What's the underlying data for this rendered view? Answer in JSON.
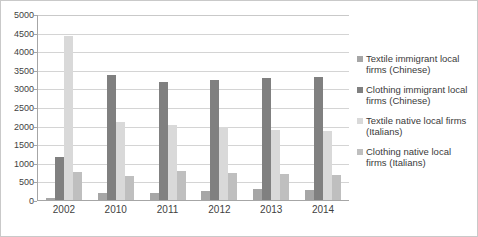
{
  "chart_data": {
    "type": "bar",
    "title": "",
    "subtitle": "",
    "xlabel": "",
    "ylabel": "",
    "categories": [
      "2002",
      "2010",
      "2011",
      "2012",
      "2013",
      "2014"
    ],
    "series": [
      {
        "name": "Textile immigrant local firms (Chinese)",
        "color": "#a6a6a6",
        "values": [
          60,
          180,
          200,
          240,
          300,
          280
        ]
      },
      {
        "name": "Clothing immigrant local firms (Chinese)",
        "color": "#808080",
        "values": [
          1150,
          3370,
          3180,
          3220,
          3290,
          3300
        ]
      },
      {
        "name": "Textile native local firms (Italians)",
        "color": "#d9d9d9",
        "values": [
          4400,
          2100,
          2020,
          1970,
          1880,
          1860
        ]
      },
      {
        "name": "Clothing native local firms (Italians)",
        "color": "#bfbfbf",
        "values": [
          760,
          640,
          790,
          720,
          690,
          660
        ]
      }
    ],
    "ylim": [
      0,
      5000
    ],
    "ytick_step": 500,
    "yticks": [
      "0",
      "500",
      "1000",
      "1500",
      "2000",
      "2500",
      "3000",
      "3500",
      "4000",
      "4500",
      "5000"
    ],
    "grid": true,
    "legend_position": "right"
  },
  "legend": {
    "items": [
      {
        "label": "Textile immigrant local firms (Chinese)",
        "color": "#a6a6a6"
      },
      {
        "label": "Clothing immigrant local firms (Chinese)",
        "color": "#808080"
      },
      {
        "label": "Textile native local firms (Italians)",
        "color": "#d9d9d9"
      },
      {
        "label": "Clothing native local firms (Italians)",
        "color": "#bfbfbf"
      }
    ]
  },
  "colors": {
    "frame_border": "#c9c9c9",
    "gridline": "#d4d4d4",
    "axis_line": "#a6a6a6",
    "text": "#3f3f3f",
    "background": "#ffffff"
  }
}
